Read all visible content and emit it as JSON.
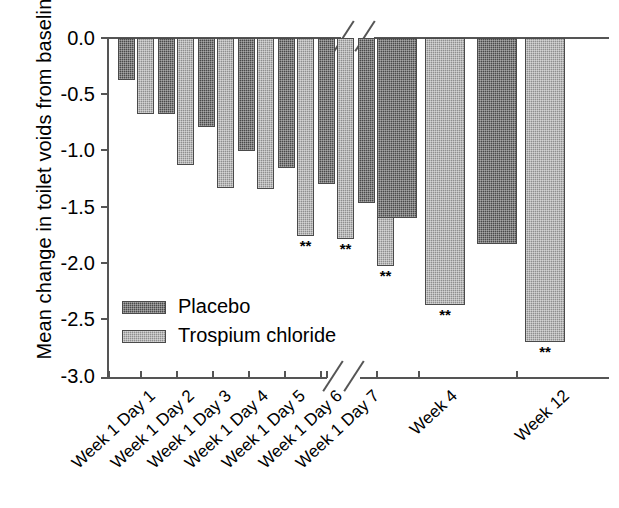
{
  "chart_data": {
    "type": "bar",
    "title": "",
    "xlabel": "",
    "ylabel": "Mean change in toilet voids from baseline",
    "ylim": [
      -3.0,
      0.0
    ],
    "yticks": [
      "0.0",
      "-0.5",
      "-1.0",
      "-1.5",
      "-2.0",
      "-2.5",
      "-3.0"
    ],
    "ytick_values": [
      0.0,
      -0.5,
      -1.0,
      -1.5,
      -2.0,
      -2.5,
      -3.0
    ],
    "grid": false,
    "axis_break": true,
    "axis_break_note": "x-axis broken between Week 1 Day 7 and Week 4",
    "legend_position": "inside-lower-left",
    "categories": [
      "Week 1 Day 1",
      "Week 1 Day 2",
      "Week 1 Day 3",
      "Week 1 Day 4",
      "Week 1 Day 5",
      "Week 1 Day 6",
      "Week 1 Day 7",
      "Week 4",
      "Week 12"
    ],
    "series": [
      {
        "name": "Placebo",
        "color": "#4a4a4a",
        "values": [
          -0.37,
          -0.67,
          -0.79,
          -1.0,
          -1.15,
          -1.29,
          -1.46,
          -1.59,
          -1.82
        ],
        "significance": [
          "",
          "",
          "",
          "",
          "",
          "",
          "",
          "",
          ""
        ]
      },
      {
        "name": "Trospium chloride",
        "color": "#8e8e8e",
        "values": [
          -0.67,
          -1.12,
          -1.33,
          -1.34,
          -1.75,
          -1.78,
          -2.02,
          -2.36,
          -2.69
        ],
        "significance": [
          "",
          "",
          "",
          "",
          "**",
          "**",
          "**",
          "**",
          "**"
        ]
      }
    ],
    "significance_marker": "**"
  },
  "legend": {
    "items": [
      {
        "label": "Placebo",
        "swatch": "placebo-swatch"
      },
      {
        "label": "Trospium chloride",
        "swatch": "trospium-swatch"
      }
    ]
  }
}
